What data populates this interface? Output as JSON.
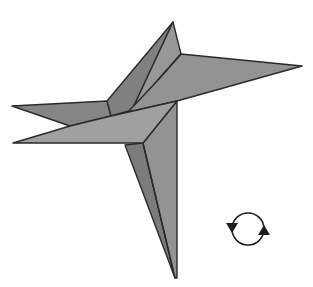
{
  "diagram": {
    "type": "origami-fold-step",
    "background_color": "#ffffff",
    "colors": {
      "dark_face": "#7e7e7e",
      "mid_face": "#8f8f8f",
      "light_face": "#9d9d9d",
      "outline": "#2a2a2a"
    },
    "flaps": [
      {
        "name": "top-flap",
        "tip": [
          173,
          22
        ]
      },
      {
        "name": "right-flap",
        "tip": [
          302,
          66
        ]
      },
      {
        "name": "upper-left-flap",
        "tip": [
          12,
          106
        ]
      },
      {
        "name": "lower-left-flap",
        "tip": [
          13,
          143
        ]
      },
      {
        "name": "bottom-flap",
        "tip": [
          175,
          278
        ]
      }
    ],
    "symbols": [
      {
        "name": "turn-over-symbol",
        "meaning": "turn model over",
        "center": [
          248,
          229
        ],
        "radius": 17
      }
    ]
  }
}
